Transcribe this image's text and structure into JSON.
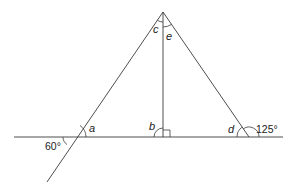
{
  "diagram": {
    "colors": {
      "line": "#3a3a3a",
      "text": "#222222",
      "background": "#ffffff"
    },
    "points": {
      "apex": [
        163,
        12
      ],
      "left_base": [
        72,
        137
      ],
      "right_base": [
        249,
        137
      ],
      "foot": [
        163,
        137
      ],
      "baseline_start": [
        14,
        137
      ],
      "baseline_end": [
        283,
        137
      ],
      "left_extension_end": [
        47,
        182
      ]
    },
    "labels": {
      "a": "a",
      "b": "b",
      "c": "c",
      "d": "d",
      "e": "e",
      "angle_60": "60°",
      "angle_125": "125°"
    },
    "right_angle_marker": true
  }
}
